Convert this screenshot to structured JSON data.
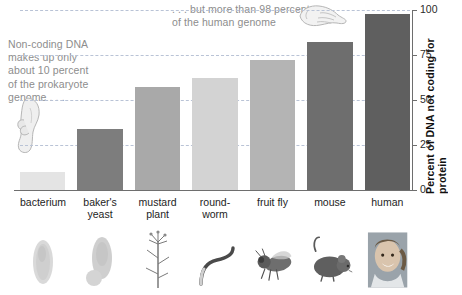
{
  "chart_data": {
    "type": "bar",
    "title": "",
    "xlabel": "",
    "ylabel": "Percent of DNA not coding for protein",
    "ylim": [
      0,
      100
    ],
    "yticks": [
      0,
      25,
      50,
      75,
      100
    ],
    "gridlines": [
      25,
      50,
      75,
      100
    ],
    "grid": true,
    "legend": "none",
    "categories": [
      "bacterium",
      "baker's\nyeast",
      "mustard\nplant",
      "round-\nworm",
      "fruit fly",
      "mouse",
      "human"
    ],
    "values": [
      10,
      34,
      57,
      62,
      72,
      82,
      98
    ],
    "bar_colors": [
      "#e4e4e4",
      "#7d7d7d",
      "#a9a9a9",
      "#d3d3d3",
      "#b4b4b4",
      "#6e6e6e",
      "#5f5f5f"
    ],
    "annotations": [
      {
        "name": "prokaryote-note",
        "text": "Non-coding DNA\nmakes up only\nabout 10 percent\nof the prokaryote\ngenome . . ."
      },
      {
        "name": "human-genome-note",
        "text": ". . . but more than 98 percent\nof the human genome"
      }
    ]
  },
  "axis": {
    "tick_labels": [
      "100",
      "75",
      "50",
      "25",
      "0"
    ],
    "y_title": "Percent of DNA not coding for protein"
  },
  "categories": [
    {
      "label": "bacterium",
      "picture": "bacterium-image"
    },
    {
      "label": "baker's\nyeast",
      "picture": "yeast-image"
    },
    {
      "label": "mustard\nplant",
      "picture": "mustard-plant-image"
    },
    {
      "label": "round-\nworm",
      "picture": "roundworm-image"
    },
    {
      "label": "fruit fly",
      "picture": "fruit-fly-image"
    },
    {
      "label": "mouse",
      "picture": "mouse-image"
    },
    {
      "label": "human",
      "picture": "human-image"
    }
  ],
  "annotations": {
    "left": "Non-coding DNA\nmakes up only\nabout 10 percent\nof the prokaryote\ngenome . . .",
    "right": ". . . but more than 98 percent\nof the human genome"
  },
  "icons": {
    "left_hand": "pointing-hand-icon",
    "right_hand": "pointing-hand-icon"
  },
  "colors": {
    "gridline": "#b9c3d6",
    "axis": "#6e6e6e",
    "annotation_text": "#8d8d8d",
    "label_text": "#1d1d1d"
  }
}
